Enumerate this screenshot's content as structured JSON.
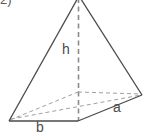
{
  "figure": {
    "item_marker": "2)",
    "shape_name": "square-pyramid",
    "labels": {
      "height": "h",
      "base_edge_right": "a",
      "base_edge_left": "b"
    },
    "colors": {
      "solid_edge": "#4a4a4a",
      "hidden_edge": "#9a9a9a",
      "label_text": "#4a4a4a",
      "background": "#ffffff"
    },
    "geometry": {
      "apex": [
        79,
        -4
      ],
      "base_front": [
        78,
        121
      ],
      "base_left": [
        9,
        121
      ],
      "base_right": [
        142,
        95
      ],
      "base_back": [
        78,
        92
      ],
      "height_foot": [
        78,
        121
      ]
    },
    "line_styles": {
      "visible": "solid",
      "hidden": "dashed",
      "height_line": "dashed"
    }
  }
}
